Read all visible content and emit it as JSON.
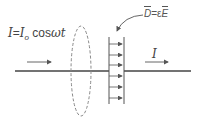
{
  "diagram": {
    "current_equation": {
      "lhs": "I",
      "equals": "=",
      "amplitude": "I",
      "amplitude_subscript": "o",
      "function": " cos",
      "argument": "ωt"
    },
    "displacement_label": {
      "vector_d": "D",
      "equals": "=",
      "epsilon": "ε",
      "vector_e": "E"
    },
    "current_label": "I",
    "colors": {
      "wire": "#444444",
      "dashed_loop": "#888888",
      "text": "#444444",
      "arrows": "#555555"
    },
    "field_arrow_count": 6
  }
}
